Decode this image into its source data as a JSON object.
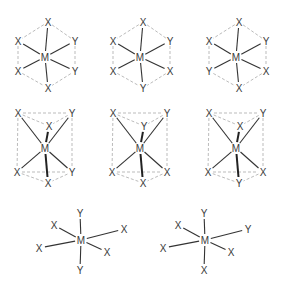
{
  "center_label": "M",
  "molecules": [
    {
      "id": "oct-1",
      "geometry": "octahedral-projection",
      "ligands": {
        "top": "X",
        "upper_left": "X",
        "upper_right": "Y",
        "lower_left": "X",
        "lower_right": "Y",
        "bottom": "X"
      }
    },
    {
      "id": "oct-2",
      "geometry": "octahedral-projection",
      "ligands": {
        "top": "X",
        "upper_left": "X",
        "upper_right": "Y",
        "lower_left": "X",
        "lower_right": "X",
        "bottom": "Y"
      }
    },
    {
      "id": "oct-3",
      "geometry": "octahedral-projection",
      "ligands": {
        "top": "X",
        "upper_left": "X",
        "upper_right": "Y",
        "lower_left": "Y",
        "lower_right": "X",
        "bottom": "X"
      }
    },
    {
      "id": "prism-1",
      "geometry": "trigonal-prism",
      "ligands": {
        "back_top_left": "X",
        "back_top_right": "Y",
        "front_top": "X",
        "back_bottom_left": "X",
        "back_bottom_right": "Y",
        "front_bottom": "X"
      }
    },
    {
      "id": "prism-2",
      "geometry": "trigonal-prism",
      "ligands": {
        "back_top_left": "X",
        "back_top_right": "Y",
        "front_top": "Y",
        "back_bottom_left": "X",
        "back_bottom_right": "X",
        "front_bottom": "X"
      }
    },
    {
      "id": "prism-3",
      "geometry": "trigonal-prism",
      "ligands": {
        "back_top_left": "X",
        "back_top_right": "Y",
        "front_top": "X",
        "back_bottom_left": "X",
        "back_bottom_right": "X",
        "front_bottom": "Y"
      }
    },
    {
      "id": "perspective-1",
      "geometry": "octahedral-perspective",
      "ligands": {
        "top": "Y",
        "upper_left": "X",
        "right": "X",
        "left": "X",
        "lower_right": "X",
        "bottom": "Y"
      }
    },
    {
      "id": "perspective-2",
      "geometry": "octahedral-perspective",
      "ligands": {
        "top": "Y",
        "upper_left": "X",
        "right": "Y",
        "left": "X",
        "lower_right": "X",
        "bottom": "X"
      }
    }
  ]
}
